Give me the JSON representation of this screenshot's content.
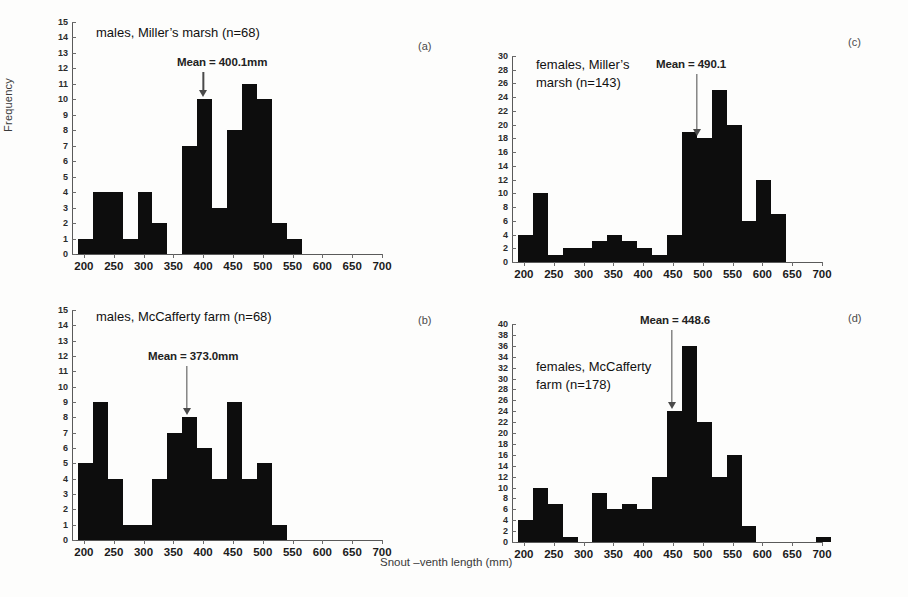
{
  "figure": {
    "xlabel": "Snout –venth length (mm)",
    "ylabel": "Frequency"
  },
  "chart_data": [
    {
      "type": "bar",
      "panel": "(a)",
      "title": "males, Miller’s marsh (n=68)",
      "annotation": "Mean = 400.1mm",
      "mean": 400.1,
      "n": 68,
      "xlabel": "Snout –venth length (mm)",
      "ylabel": "Frequency",
      "xlim": [
        180,
        700
      ],
      "ylim": [
        0,
        15
      ],
      "ytick_step": 1,
      "xticks": [
        200,
        250,
        300,
        350,
        400,
        450,
        500,
        550,
        600,
        650,
        700
      ],
      "yticks": [
        0,
        1,
        2,
        3,
        4,
        5,
        6,
        7,
        8,
        9,
        10,
        11,
        12,
        13,
        14,
        15
      ],
      "grid": false,
      "bin_width": 25,
      "bins": [
        190,
        215,
        240,
        265,
        290,
        315,
        340,
        365,
        390,
        415,
        440,
        465,
        490,
        515,
        540,
        565
      ],
      "values": [
        1,
        4,
        4,
        1,
        4,
        2,
        0,
        7,
        10,
        3,
        8,
        11,
        10,
        2,
        1
      ]
    },
    {
      "type": "bar",
      "panel": "(b)",
      "title": "males, McCafferty farm (n=68)",
      "annotation": "Mean = 373.0mm",
      "mean": 373.0,
      "n": 68,
      "xlabel": "Snout –venth length (mm)",
      "ylabel": "Frequency",
      "xlim": [
        180,
        700
      ],
      "ylim": [
        0,
        15
      ],
      "ytick_step": 1,
      "xticks": [
        200,
        250,
        300,
        350,
        400,
        450,
        500,
        550,
        600,
        650,
        700
      ],
      "yticks": [
        0,
        1,
        2,
        3,
        4,
        5,
        6,
        7,
        8,
        9,
        10,
        11,
        12,
        13,
        14,
        15
      ],
      "grid": false,
      "bin_width": 25,
      "bins": [
        190,
        215,
        240,
        265,
        290,
        315,
        340,
        365,
        390,
        415,
        440,
        465,
        490,
        515
      ],
      "values": [
        5,
        9,
        4,
        1,
        1,
        4,
        7,
        8,
        6,
        4,
        9,
        4,
        5,
        1
      ]
    },
    {
      "type": "bar",
      "panel": "(c)",
      "title": "females, Miller’s\nmarsh (n=143)",
      "annotation": "Mean = 490.1",
      "mean": 490.1,
      "n": 143,
      "xlabel": "Snout –venth length (mm)",
      "ylabel": "Frequency",
      "xlim": [
        180,
        700
      ],
      "ylim": [
        0,
        30
      ],
      "ytick_step": 2,
      "xticks": [
        200,
        250,
        300,
        350,
        400,
        450,
        500,
        550,
        600,
        650,
        700
      ],
      "yticks": [
        0,
        2,
        4,
        6,
        8,
        10,
        12,
        14,
        16,
        18,
        20,
        22,
        24,
        26,
        28,
        30
      ],
      "grid": false,
      "bin_width": 25,
      "bins": [
        190,
        215,
        240,
        265,
        290,
        315,
        340,
        365,
        390,
        415,
        440,
        465,
        490,
        515,
        540,
        565,
        590,
        615
      ],
      "values": [
        4,
        10,
        1,
        2,
        2,
        3,
        4,
        3,
        2,
        1,
        4,
        19,
        18,
        25,
        20,
        6,
        12,
        7
      ]
    },
    {
      "type": "bar",
      "panel": "(d)",
      "title": "females, McCafferty\nfarm (n=178)",
      "annotation": "Mean = 448.6",
      "mean": 448.6,
      "n": 178,
      "xlabel": "Snout –venth length (mm)",
      "ylabel": "Frequency",
      "xlim": [
        180,
        700
      ],
      "ylim": [
        0,
        40
      ],
      "ytick_step": 2,
      "xticks": [
        200,
        250,
        300,
        350,
        400,
        450,
        500,
        550,
        600,
        650,
        700
      ],
      "yticks": [
        0,
        2,
        4,
        6,
        8,
        10,
        12,
        14,
        16,
        18,
        20,
        22,
        24,
        26,
        28,
        30,
        32,
        34,
        36,
        38,
        40
      ],
      "grid": false,
      "bin_width": 25,
      "bins": [
        190,
        215,
        240,
        265,
        290,
        315,
        340,
        365,
        390,
        415,
        440,
        465,
        490,
        515,
        540,
        565,
        590,
        615,
        640,
        665,
        690
      ],
      "values": [
        4,
        10,
        7,
        1,
        0,
        9,
        6,
        7,
        6,
        12,
        24,
        36,
        22,
        12,
        16,
        3,
        0,
        0,
        0,
        0,
        1
      ]
    }
  ]
}
